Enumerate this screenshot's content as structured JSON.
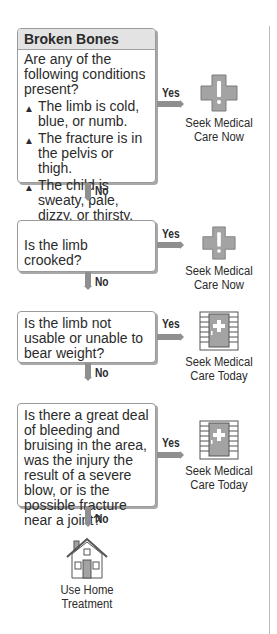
{
  "title": "Broken Bones",
  "steps": [
    {
      "question": "Are any of the following conditions present?",
      "conditions": [
        "The limb is cold, blue, or numb.",
        "The fracture is in the pelvis or thigh.",
        "The child is sweaty, pale, dizzy, or thirsty."
      ],
      "yes_label": "Yes",
      "no_label": "No",
      "outcome": {
        "icon": "medical-cross-icon",
        "line1": "Seek Medical",
        "line2": "Care Now"
      }
    },
    {
      "question": "Is the limb crooked?",
      "yes_label": "Yes",
      "no_label": "No",
      "outcome": {
        "icon": "medical-cross-icon",
        "line1": "Seek Medical",
        "line2": "Care Now"
      }
    },
    {
      "question": "Is the limb not usable or unable to bear weight?",
      "yes_label": "Yes",
      "no_label": "No",
      "outcome": {
        "icon": "clinic-door-icon",
        "line1": "Seek Medical",
        "line2": "Care Today"
      }
    },
    {
      "question": "Is there a great deal of bleeding and bruising in the area, was the injury the result of a severe blow, or is the possible fracture near a joint?",
      "yes_label": "Yes",
      "no_label": "No",
      "outcome": {
        "icon": "clinic-door-icon",
        "line1": "Seek Medical",
        "line2": "Care Today"
      }
    }
  ],
  "final": {
    "icon": "house-icon",
    "line1": "Use Home",
    "line2": "Treatment"
  },
  "colors": {
    "arrow": "#8f8f8f",
    "icon_fill": "#a3a3a3",
    "header_bg": "#e3e3e3",
    "border": "#9a9a9a"
  }
}
